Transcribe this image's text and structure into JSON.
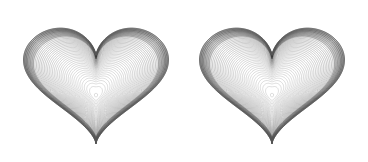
{
  "figure": {
    "title": "",
    "background_color": "#ffffff",
    "width": 368,
    "height": 162,
    "panel_count": 2
  },
  "chart_data": {
    "type": "line",
    "subtype": "contour",
    "title": "",
    "subtitle": "",
    "xlabel": "",
    "ylabel": "",
    "grid": false,
    "legend": false,
    "legend_position": "none",
    "axes_visible": false,
    "tick_labels_visible": false,
    "xlim": [
      -1.35,
      1.35
    ],
    "ylim": [
      -1.35,
      1.35
    ],
    "contour_levels": 40,
    "level_min": 0.0,
    "level_max": 1.0,
    "line_color": "#888888",
    "line_color_outer": "#555555",
    "line_width": 0.6,
    "colormap": "none",
    "filled": false,
    "panels": [
      {
        "name": "heart-contour-left",
        "index": 0,
        "center_x": 96,
        "center_y": 80,
        "bbox": [
          18,
          14,
          154,
          128
        ],
        "scale": 1.0,
        "inner_contour_center": [
          96,
          93
        ],
        "inner_contour_size": [
          16,
          28
        ],
        "cusp_y": 22,
        "lobe_peak_y": 14,
        "tip": [
          96,
          142
        ]
      },
      {
        "name": "heart-contour-right",
        "index": 1,
        "center_x": 272,
        "center_y": 80,
        "bbox": [
          194,
          14,
          154,
          128
        ],
        "scale": 1.0,
        "inner_contour_center": [
          272,
          93
        ],
        "inner_contour_size": [
          16,
          28
        ],
        "cusp_y": 22,
        "lobe_peak_y": 14,
        "tip": [
          272,
          142
        ]
      }
    ],
    "shape": "heart",
    "shape_equation": "(x^2 + y^2 - 1)^3 - x^2 * y^3 = 0"
  }
}
